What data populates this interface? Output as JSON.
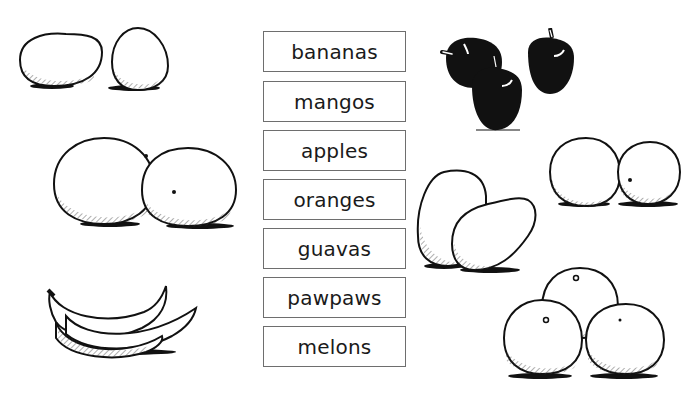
{
  "words": [
    {
      "label": "bananas",
      "top": 31
    },
    {
      "label": "mangos",
      "top": 81
    },
    {
      "label": "apples",
      "top": 130
    },
    {
      "label": "oranges",
      "top": 179
    },
    {
      "label": "guavas",
      "top": 228
    },
    {
      "label": "pawpaws",
      "top": 277
    },
    {
      "label": "melons",
      "top": 326
    }
  ],
  "pictures": [
    {
      "name": "guavas-picture",
      "position": "top-left"
    },
    {
      "name": "apples-picture",
      "position": "top-right"
    },
    {
      "name": "melons-picture",
      "position": "middle-left"
    },
    {
      "name": "oranges-picture-pair",
      "position": "middle-right"
    },
    {
      "name": "mangos-picture",
      "position": "center-right"
    },
    {
      "name": "bananas-picture",
      "position": "bottom-left"
    },
    {
      "name": "oranges-picture-pile",
      "position": "bottom-right"
    }
  ],
  "colors": {
    "ink": "#111111",
    "box_border": "#6e6e6e",
    "background": "#ffffff"
  }
}
